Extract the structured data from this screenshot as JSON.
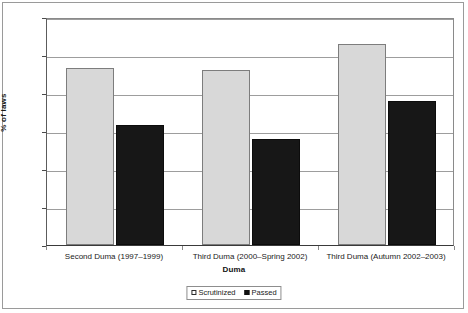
{
  "chart_data": {
    "type": "bar",
    "title": "",
    "xlabel": "Duma",
    "ylabel": "% of laws",
    "ylim": [
      0,
      60
    ],
    "ytick_step": 10,
    "yticks": [
      "0",
      "10",
      "20",
      "30",
      "40",
      "50",
      "60"
    ],
    "grid": true,
    "legend_position": "bottom-center",
    "categories": [
      "Second Duma (1997–1999)",
      "Third Duma (2000–Spring 2002)",
      "Third Duma (Autumn 2002–2003)"
    ],
    "series": [
      {
        "name": "Scrutinized",
        "color": "#d8d8d8",
        "values": [
          46.5,
          46,
          53
        ]
      },
      {
        "name": "Passed",
        "color": "#171717",
        "values": [
          31.5,
          28,
          38
        ]
      }
    ]
  },
  "legend": {
    "items": [
      {
        "label": "Scrutinized"
      },
      {
        "label": "Passed"
      }
    ]
  }
}
